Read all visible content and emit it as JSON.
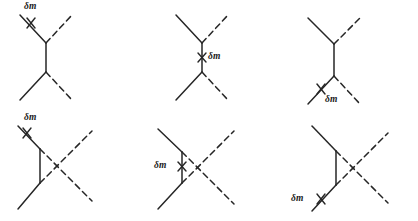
{
  "figure": {
    "title": "",
    "background_color": "#ffffff",
    "line_color": "#262626",
    "panel_count": 6,
    "panels": [
      {
        "id": "panel-1",
        "position": "top-left",
        "topology": "tree-exchange",
        "counterterm_label": "δm",
        "counterterm_cross": "×",
        "counterterm_location": "upper-left-incoming-fermion-line",
        "label_text": "δm"
      },
      {
        "id": "panel-2",
        "position": "top-center",
        "topology": "tree-exchange",
        "counterterm_label": "δm",
        "counterterm_cross": "×",
        "counterterm_location": "internal-vertical-propagator",
        "label_text": "δm"
      },
      {
        "id": "panel-3",
        "position": "top-right",
        "topology": "tree-exchange",
        "counterterm_label": "δm",
        "counterterm_cross": "×",
        "counterterm_location": "lower-left-outgoing-fermion-line",
        "label_text": "δm"
      },
      {
        "id": "panel-4",
        "position": "bottom-left",
        "topology": "crossed-exchange",
        "counterterm_label": "δm",
        "counterterm_cross": "×",
        "counterterm_location": "upper-left-incoming-fermion-line",
        "label_text": "δm"
      },
      {
        "id": "panel-5",
        "position": "bottom-center",
        "topology": "crossed-exchange",
        "counterterm_label": "δm",
        "counterterm_cross": "×",
        "counterterm_location": "internal-vertical-propagator",
        "label_text": "δm"
      },
      {
        "id": "panel-6",
        "position": "bottom-right",
        "topology": "crossed-exchange",
        "counterterm_label": "δm",
        "counterterm_cross": "×",
        "counterterm_location": "lower-left-outgoing-fermion-line",
        "label_text": "δm"
      }
    ]
  },
  "labels": {
    "p1": "δm",
    "p2_cross": "×",
    "p2": "δm",
    "p3": "δm",
    "p4": "δm",
    "p5": "δm",
    "p5_cross": "×",
    "p6": "δm"
  }
}
